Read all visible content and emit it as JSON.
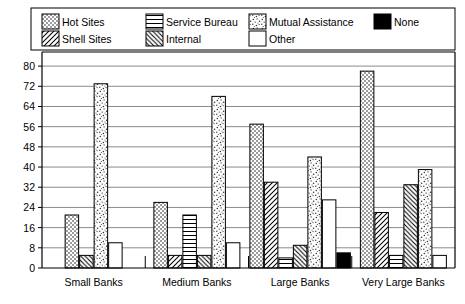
{
  "chart_data": {
    "type": "bar",
    "title": "",
    "subtitle": "",
    "xlabel": "",
    "ylabel": "",
    "ylim": [
      0,
      84
    ],
    "yticks": [
      0,
      8,
      16,
      24,
      32,
      40,
      48,
      56,
      64,
      72,
      80
    ],
    "ytick_labels": [
      "0",
      "8",
      "16",
      "24",
      "32",
      "40",
      "48",
      "56",
      "64",
      "72",
      "80"
    ],
    "grid": true,
    "grid_axis": "y",
    "legend_position": "top",
    "categories": [
      "Small Banks",
      "Medium Banks",
      "Large Banks",
      "Very Large Banks"
    ],
    "series": [
      {
        "name": "Hot Sites",
        "pattern": "checker-gray",
        "values": [
          21,
          26,
          57,
          78
        ]
      },
      {
        "name": "Shell Sites",
        "pattern": "diagonal-fwd",
        "values": [
          null,
          5,
          34,
          22
        ]
      },
      {
        "name": "Service Bureau",
        "pattern": "horizontal",
        "values": [
          null,
          21,
          4,
          5
        ]
      },
      {
        "name": "Internal",
        "pattern": "diagonal-back",
        "values": [
          5,
          5,
          9,
          33
        ]
      },
      {
        "name": "Mutual Assistance",
        "pattern": "stipple",
        "values": [
          73,
          68,
          44,
          39
        ]
      },
      {
        "name": "Other",
        "pattern": "solid-white",
        "values": [
          10,
          10,
          27,
          5
        ]
      },
      {
        "name": "None",
        "pattern": "solid-black",
        "values": [
          null,
          null,
          6,
          null
        ]
      }
    ]
  },
  "legend": {
    "items": [
      {
        "label": "Hot Sites",
        "swatch": "checker-gray"
      },
      {
        "label": "Shell Sites",
        "swatch": "diagonal-fwd"
      },
      {
        "label": "Service Bureau",
        "swatch": "horizontal"
      },
      {
        "label": "Internal",
        "swatch": "diagonal-back"
      },
      {
        "label": "Mutual Assistance",
        "swatch": "stipple"
      },
      {
        "label": "Other",
        "swatch": "solid-white"
      },
      {
        "label": "None",
        "swatch": "solid-black"
      }
    ]
  },
  "colors": {
    "ink": "#000000",
    "grid": "#8a8a8a",
    "plot_background": "#ffffff",
    "gray_fill": "#b8b8b8",
    "black_fill": "#000000"
  }
}
